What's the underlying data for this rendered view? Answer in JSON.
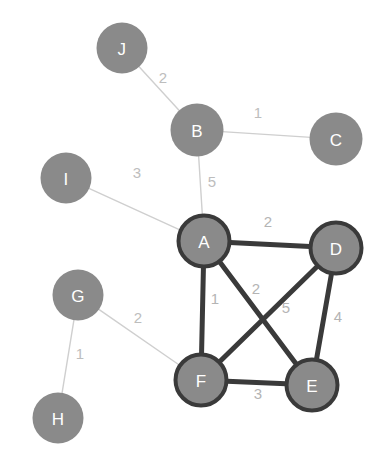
{
  "graph": {
    "title": "Weighted undirected graph with highlighted clique",
    "colors": {
      "node_fill": "#8a8a8a",
      "node_text": "#ffffff",
      "highlight_stroke": "#3a3a3a",
      "normal_stroke": "#8a8a8a",
      "edge_highlight": "#3a3a3a",
      "edge_normal": "#cfcfcf",
      "label_text": "#b4b4b4",
      "background": "#ffffff"
    },
    "nodes": [
      {
        "id": "J",
        "label": "J",
        "x": 122,
        "y": 48,
        "r": 26,
        "highlighted": false
      },
      {
        "id": "B",
        "label": "B",
        "x": 197,
        "y": 130,
        "r": 27,
        "highlighted": false
      },
      {
        "id": "C",
        "label": "C",
        "x": 336,
        "y": 139,
        "r": 27,
        "highlighted": false
      },
      {
        "id": "I",
        "label": "I",
        "x": 66,
        "y": 178,
        "r": 26,
        "highlighted": false
      },
      {
        "id": "A",
        "label": "A",
        "x": 204,
        "y": 241,
        "r": 28,
        "highlighted": true
      },
      {
        "id": "D",
        "label": "D",
        "x": 336,
        "y": 248,
        "r": 28,
        "highlighted": true
      },
      {
        "id": "G",
        "label": "G",
        "x": 78,
        "y": 295,
        "r": 26,
        "highlighted": false
      },
      {
        "id": "F",
        "label": "F",
        "x": 201,
        "y": 380,
        "r": 28,
        "highlighted": true
      },
      {
        "id": "E",
        "label": "E",
        "x": 312,
        "y": 385,
        "r": 28,
        "highlighted": true
      },
      {
        "id": "H",
        "label": "H",
        "x": 58,
        "y": 418,
        "r": 26,
        "highlighted": false
      }
    ],
    "edges": [
      {
        "id": "J-B",
        "source": "J",
        "target": "B",
        "weight": "2",
        "highlighted": false,
        "label_x": 163,
        "label_y": 77
      },
      {
        "id": "B-C",
        "source": "B",
        "target": "C",
        "weight": "1",
        "highlighted": false,
        "label_x": 258,
        "label_y": 112
      },
      {
        "id": "B-A",
        "source": "B",
        "target": "A",
        "weight": "5",
        "highlighted": false,
        "label_x": 212,
        "label_y": 181
      },
      {
        "id": "I-A",
        "source": "I",
        "target": "A",
        "weight": "3",
        "highlighted": false,
        "label_x": 137,
        "label_y": 172
      },
      {
        "id": "A-D",
        "source": "A",
        "target": "D",
        "weight": "2",
        "highlighted": true,
        "label_x": 268,
        "label_y": 221
      },
      {
        "id": "A-F",
        "source": "A",
        "target": "F",
        "weight": "1",
        "highlighted": true,
        "label_x": 215,
        "label_y": 298
      },
      {
        "id": "A-E",
        "source": "A",
        "target": "E",
        "weight": "2",
        "highlighted": true,
        "label_x": 256,
        "label_y": 288
      },
      {
        "id": "D-F",
        "source": "D",
        "target": "F",
        "weight": "5",
        "highlighted": true,
        "label_x": 286,
        "label_y": 307
      },
      {
        "id": "D-E",
        "source": "D",
        "target": "E",
        "weight": "4",
        "highlighted": true,
        "label_x": 338,
        "label_y": 316
      },
      {
        "id": "F-E",
        "source": "F",
        "target": "E",
        "weight": "3",
        "highlighted": true,
        "label_x": 258,
        "label_y": 393
      },
      {
        "id": "G-F",
        "source": "G",
        "target": "F",
        "weight": "2",
        "highlighted": false,
        "label_x": 138,
        "label_y": 317
      },
      {
        "id": "G-H",
        "source": "G",
        "target": "H",
        "weight": "1",
        "highlighted": false,
        "label_x": 80,
        "label_y": 353
      }
    ]
  }
}
